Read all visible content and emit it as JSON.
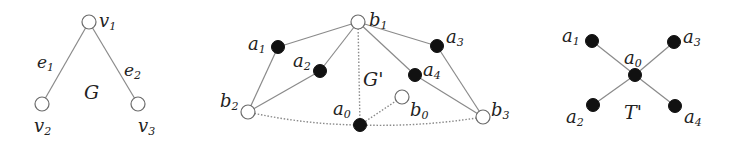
{
  "figure": {
    "graphs": [
      {
        "id": "G",
        "name": "G",
        "nodes": [
          {
            "id": "v1",
            "label": "v",
            "sub": "1",
            "x": 89,
            "y": 22,
            "type": "open",
            "lx": 99,
            "ly": 27
          },
          {
            "id": "v2",
            "label": "v",
            "sub": "2",
            "x": 42,
            "y": 104,
            "type": "open",
            "lx": 34,
            "ly": 132
          },
          {
            "id": "v3",
            "label": "v",
            "sub": "3",
            "x": 138,
            "y": 104,
            "type": "open",
            "lx": 138,
            "ly": 132
          }
        ],
        "edges": [
          {
            "from": "v1",
            "to": "v2",
            "label": "e",
            "sub": "1",
            "style": "solid",
            "lx": 37,
            "ly": 68
          },
          {
            "from": "v1",
            "to": "v3",
            "label": "e",
            "sub": "2",
            "style": "solid",
            "lx": 124,
            "ly": 76
          }
        ],
        "title_pos": {
          "x": 84,
          "y": 99
        }
      },
      {
        "id": "Gprime",
        "name": "G'",
        "nodes": [
          {
            "id": "b1",
            "label": "b",
            "sub": "1",
            "x": 358,
            "y": 22,
            "type": "open",
            "lx": 369,
            "ly": 26
          },
          {
            "id": "a1",
            "label": "a",
            "sub": "1",
            "x": 278,
            "y": 47,
            "type": "filled",
            "lx": 248,
            "ly": 50
          },
          {
            "id": "a2",
            "label": "a",
            "sub": "2",
            "x": 320,
            "y": 71,
            "type": "filled",
            "lx": 293,
            "ly": 67
          },
          {
            "id": "a3",
            "label": "a",
            "sub": "3",
            "x": 437,
            "y": 46,
            "type": "filled",
            "lx": 446,
            "ly": 43
          },
          {
            "id": "a4",
            "label": "a",
            "sub": "4",
            "x": 415,
            "y": 75,
            "type": "filled",
            "lx": 423,
            "ly": 76
          },
          {
            "id": "b2",
            "label": "b",
            "sub": "2",
            "x": 248,
            "y": 112,
            "type": "open",
            "lx": 220,
            "ly": 107
          },
          {
            "id": "a0",
            "label": "a",
            "sub": "0",
            "x": 360,
            "y": 125,
            "type": "filled",
            "lx": 333,
            "ly": 115
          },
          {
            "id": "b0",
            "label": "b",
            "sub": "0",
            "x": 402,
            "y": 97,
            "type": "open",
            "lx": 410,
            "ly": 116
          },
          {
            "id": "b3",
            "label": "b",
            "sub": "3",
            "x": 483,
            "y": 117,
            "type": "open",
            "lx": 491,
            "ly": 116
          }
        ],
        "edges": [
          {
            "from": "b1",
            "to": "a1",
            "style": "solid"
          },
          {
            "from": "b1",
            "to": "a2",
            "style": "solid"
          },
          {
            "from": "b1",
            "to": "a3",
            "style": "solid"
          },
          {
            "from": "b1",
            "to": "a4",
            "style": "solid"
          },
          {
            "from": "b1",
            "to": "a0",
            "style": "dotted"
          },
          {
            "from": "a1",
            "to": "b2",
            "style": "solid"
          },
          {
            "from": "a2",
            "to": "b2",
            "style": "solid"
          },
          {
            "from": "a3",
            "to": "b3",
            "style": "solid"
          },
          {
            "from": "a4",
            "to": "b3",
            "style": "solid"
          },
          {
            "from": "a0",
            "to": "b0",
            "style": "dotted"
          },
          {
            "from": "b2",
            "to": "a0",
            "style": "dotted-curve"
          },
          {
            "from": "a0",
            "to": "b3",
            "style": "dotted-curve"
          }
        ],
        "title_pos": {
          "x": 363,
          "y": 86
        }
      },
      {
        "id": "Tprime",
        "name": "T'",
        "nodes": [
          {
            "id": "a1",
            "label": "a",
            "sub": "1",
            "x": 592,
            "y": 41,
            "type": "filled",
            "lx": 562,
            "ly": 42
          },
          {
            "id": "a3",
            "label": "a",
            "sub": "3",
            "x": 674,
            "y": 42,
            "type": "filled",
            "lx": 683,
            "ly": 43
          },
          {
            "id": "a0",
            "label": "a",
            "sub": "0",
            "x": 635,
            "y": 75,
            "type": "filled",
            "lx": 624,
            "ly": 64
          },
          {
            "id": "a2",
            "label": "a",
            "sub": "2",
            "x": 593,
            "y": 105,
            "type": "filled",
            "lx": 566,
            "ly": 123
          },
          {
            "id": "a4",
            "label": "a",
            "sub": "4",
            "x": 675,
            "y": 106,
            "type": "filled",
            "lx": 684,
            "ly": 123
          }
        ],
        "edges": [
          {
            "from": "a0",
            "to": "a1",
            "style": "solid"
          },
          {
            "from": "a0",
            "to": "a3",
            "style": "solid"
          },
          {
            "from": "a0",
            "to": "a2",
            "style": "solid"
          },
          {
            "from": "a0",
            "to": "a4",
            "style": "solid"
          }
        ],
        "title_pos": {
          "x": 624,
          "y": 119
        }
      }
    ]
  }
}
